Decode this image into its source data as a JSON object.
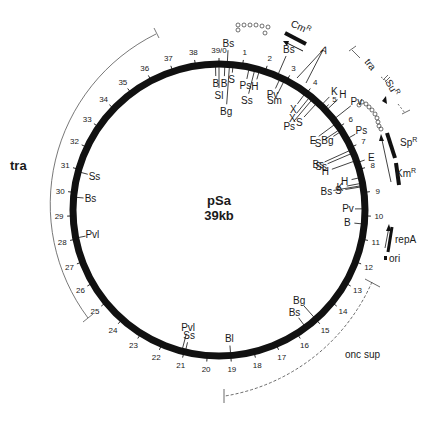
{
  "title": "pSa",
  "size_label": "39kb",
  "total_kb": 39,
  "center": {
    "x": 219,
    "y": 210
  },
  "radius": 146,
  "colors": {
    "backbone": "#111111",
    "text": "#1a1a1a",
    "arc": "#555555"
  },
  "kb_ticks": [
    {
      "pos": 0,
      "label": "39/0"
    },
    {
      "pos": 1,
      "label": "1"
    },
    {
      "pos": 2,
      "label": "2"
    },
    {
      "pos": 3,
      "label": "3"
    },
    {
      "pos": 4,
      "label": "4"
    },
    {
      "pos": 5,
      "label": "5"
    },
    {
      "pos": 6,
      "label": "6"
    },
    {
      "pos": 7,
      "label": "7"
    },
    {
      "pos": 8,
      "label": "8"
    },
    {
      "pos": 9,
      "label": "9"
    },
    {
      "pos": 10,
      "label": "10"
    },
    {
      "pos": 11,
      "label": "11"
    },
    {
      "pos": 12,
      "label": "12"
    },
    {
      "pos": 13,
      "label": "13"
    },
    {
      "pos": 14,
      "label": "14"
    },
    {
      "pos": 15,
      "label": "15"
    },
    {
      "pos": 16,
      "label": "16"
    },
    {
      "pos": 17,
      "label": "17"
    },
    {
      "pos": 18,
      "label": "18"
    },
    {
      "pos": 19,
      "label": "19"
    },
    {
      "pos": 20,
      "label": "20"
    },
    {
      "pos": 21,
      "label": "21"
    },
    {
      "pos": 22,
      "label": "22"
    },
    {
      "pos": 23,
      "label": "23"
    },
    {
      "pos": 24,
      "label": "24"
    },
    {
      "pos": 25,
      "label": "25"
    },
    {
      "pos": 26,
      "label": "26"
    },
    {
      "pos": 27,
      "label": "27"
    },
    {
      "pos": 28,
      "label": "28"
    },
    {
      "pos": 29,
      "label": "29"
    },
    {
      "pos": 30,
      "label": "30"
    },
    {
      "pos": 31,
      "label": "31"
    },
    {
      "pos": 32,
      "label": "32"
    },
    {
      "pos": 33,
      "label": "33"
    },
    {
      "pos": 34,
      "label": "34"
    },
    {
      "pos": 35,
      "label": "35"
    },
    {
      "pos": 36,
      "label": "36"
    },
    {
      "pos": 37,
      "label": "37"
    },
    {
      "pos": 38,
      "label": "38"
    }
  ],
  "sites": [
    {
      "pos": 38.85,
      "label": "B",
      "side": "in",
      "len": 12
    },
    {
      "pos": 39.0,
      "label": "Sl",
      "side": "in",
      "len": 24
    },
    {
      "pos": 0.25,
      "label": "B",
      "side": "in",
      "len": 12
    },
    {
      "pos": 0.35,
      "label": "Bs",
      "side": "out",
      "len": 14
    },
    {
      "pos": 0.45,
      "label": "Bg",
      "side": "in",
      "len": 40
    },
    {
      "pos": 0.6,
      "label": "S",
      "side": "in",
      "len": 8
    },
    {
      "pos": 1.3,
      "label": "Ps",
      "side": "in",
      "len": 12
    },
    {
      "pos": 1.55,
      "label": "Ss",
      "side": "in",
      "len": 26
    },
    {
      "pos": 1.75,
      "label": "H",
      "side": "in",
      "len": 10
    },
    {
      "pos": 2.55,
      "label": "Bs",
      "side": "out",
      "len": 22
    },
    {
      "pos": 2.7,
      "label": "Pv",
      "side": "in",
      "len": 12
    },
    {
      "pos": 2.9,
      "label": "Sm",
      "side": "in",
      "len": 16
    },
    {
      "pos": 3.95,
      "label": "X",
      "side": "in",
      "len": 14
    },
    {
      "pos": 4.2,
      "label": "X",
      "side": "in",
      "len": 22
    },
    {
      "pos": 4.35,
      "label": "Ps",
      "side": "in",
      "len": 30
    },
    {
      "pos": 4.6,
      "label": "S",
      "side": "in",
      "len": 20
    },
    {
      "pos": 4.8,
      "label": "K",
      "side": "out",
      "len": 12
    },
    {
      "pos": 5.1,
      "label": "H",
      "side": "out",
      "len": 16
    },
    {
      "pos": 5.6,
      "label": "Pv",
      "side": "out",
      "len": 22
    },
    {
      "pos": 5.8,
      "label": "E",
      "side": "in",
      "len": 22
    },
    {
      "pos": 6.1,
      "label": "S",
      "side": "in",
      "len": 20
    },
    {
      "pos": 6.2,
      "label": "Bg",
      "side": "in",
      "len": 10
    },
    {
      "pos": 6.6,
      "label": "Ps",
      "side": "out",
      "len": 10
    },
    {
      "pos": 7.1,
      "label": "Bs",
      "side": "in",
      "len": 30
    },
    {
      "pos": 7.25,
      "label": "Ss",
      "side": "in",
      "len": 28
    },
    {
      "pos": 7.6,
      "label": "H",
      "side": "in",
      "len": 26
    },
    {
      "pos": 7.7,
      "label": "E",
      "side": "out",
      "len": 8
    },
    {
      "pos": 8.35,
      "label": "H",
      "side": "in",
      "len": 10
    },
    {
      "pos": 8.6,
      "label": "K",
      "side": "in",
      "len": 16
    },
    {
      "pos": 8.7,
      "label": "Bs",
      "side": "in",
      "len": 30
    },
    {
      "pos": 8.75,
      "label": "S",
      "side": "in",
      "len": 18
    },
    {
      "pos": 9.7,
      "label": "Pv",
      "side": "in",
      "len": 10
    },
    {
      "pos": 10.35,
      "label": "B",
      "side": "in",
      "len": 10
    },
    {
      "pos": 15.0,
      "label": "Bg",
      "side": "in",
      "len": 18
    },
    {
      "pos": 15.55,
      "label": "Bs",
      "side": "in",
      "len": 12
    },
    {
      "pos": 19.0,
      "label": "Bl",
      "side": "in",
      "len": 10
    },
    {
      "pos": 20.95,
      "label": "Ss",
      "side": "in",
      "len": 10
    },
    {
      "pos": 21.1,
      "label": "Pvl",
      "side": "in",
      "len": 18
    },
    {
      "pos": 28.05,
      "label": "Pvl",
      "side": "in",
      "len": 10
    },
    {
      "pos": 29.8,
      "label": "Bs",
      "side": "in",
      "len": 10
    },
    {
      "pos": 30.9,
      "label": "Ss",
      "side": "in",
      "len": 10
    }
  ],
  "genes": [
    {
      "name": "Cm",
      "sup": "R",
      "label_x": 257,
      "label_y": 21
    },
    {
      "name": "A",
      "sup": "",
      "label_x": 321,
      "label_y": 51
    },
    {
      "name": "Su",
      "sup": "R",
      "label_x": 389,
      "label_y": 92
    },
    {
      "name": "Sp",
      "sup": "R",
      "label_x": 399,
      "label_y": 146
    },
    {
      "name": "Km",
      "sup": "R",
      "label_x": 398,
      "label_y": 174
    },
    {
      "name": "repA",
      "sup": "",
      "label_x": 395,
      "label_y": 241
    },
    {
      "name": "ori",
      "sup": "",
      "label_x": 386,
      "label_y": 261
    }
  ],
  "regions": [
    {
      "name": "tra",
      "label_x": 10,
      "label_y": 170
    },
    {
      "name": "tra",
      "label_x": 374,
      "label_y": 58
    },
    {
      "name": "onc sup",
      "label_x": 345,
      "label_y": 358
    }
  ],
  "chart_data": {
    "type": "plasmid_map",
    "title": "pSa",
    "subtitle": "39kb",
    "total_kb": 39,
    "restriction_sites": [
      {
        "kb": 38.85,
        "enzyme": "B"
      },
      {
        "kb": 39.0,
        "enzyme": "Sl"
      },
      {
        "kb": 0.25,
        "enzyme": "B"
      },
      {
        "kb": 0.35,
        "enzyme": "Bs"
      },
      {
        "kb": 0.45,
        "enzyme": "Bg"
      },
      {
        "kb": 0.6,
        "enzyme": "S"
      },
      {
        "kb": 1.3,
        "enzyme": "Ps"
      },
      {
        "kb": 1.55,
        "enzyme": "Ss"
      },
      {
        "kb": 1.75,
        "enzyme": "H"
      },
      {
        "kb": 2.55,
        "enzyme": "Bs"
      },
      {
        "kb": 2.7,
        "enzyme": "Pv"
      },
      {
        "kb": 2.9,
        "enzyme": "Sm"
      },
      {
        "kb": 3.95,
        "enzyme": "X"
      },
      {
        "kb": 4.2,
        "enzyme": "X"
      },
      {
        "kb": 4.35,
        "enzyme": "Ps"
      },
      {
        "kb": 4.6,
        "enzyme": "S"
      },
      {
        "kb": 4.8,
        "enzyme": "K"
      },
      {
        "kb": 5.1,
        "enzyme": "H"
      },
      {
        "kb": 5.6,
        "enzyme": "Pv"
      },
      {
        "kb": 5.8,
        "enzyme": "E"
      },
      {
        "kb": 6.1,
        "enzyme": "S"
      },
      {
        "kb": 6.2,
        "enzyme": "Bg"
      },
      {
        "kb": 6.6,
        "enzyme": "Ps"
      },
      {
        "kb": 7.1,
        "enzyme": "Bs"
      },
      {
        "kb": 7.25,
        "enzyme": "Ss"
      },
      {
        "kb": 7.6,
        "enzyme": "H"
      },
      {
        "kb": 7.7,
        "enzyme": "E"
      },
      {
        "kb": 8.35,
        "enzyme": "H"
      },
      {
        "kb": 8.6,
        "enzyme": "K"
      },
      {
        "kb": 8.7,
        "enzyme": "Bs"
      },
      {
        "kb": 8.75,
        "enzyme": "S"
      },
      {
        "kb": 9.7,
        "enzyme": "Pv"
      },
      {
        "kb": 10.35,
        "enzyme": "B"
      },
      {
        "kb": 15.0,
        "enzyme": "Bg"
      },
      {
        "kb": 15.55,
        "enzyme": "Bs"
      },
      {
        "kb": 19.0,
        "enzyme": "Bl"
      },
      {
        "kb": 20.95,
        "enzyme": "Ss"
      },
      {
        "kb": 21.1,
        "enzyme": "Pvl"
      },
      {
        "kb": 28.05,
        "enzyme": "Pvl"
      },
      {
        "kb": 29.8,
        "enzyme": "Bs"
      },
      {
        "kb": 30.9,
        "enzyme": "Ss"
      }
    ],
    "genes": [
      {
        "name": "CmR",
        "approx_kb": [
          2.0,
          3.0
        ]
      },
      {
        "name": "A",
        "approx_kb": [
          3.9,
          4.4
        ]
      },
      {
        "name": "SuR",
        "approx_kb": [
          6.0,
          7.0
        ]
      },
      {
        "name": "SpR",
        "approx_kb": [
          7.5,
          8.3
        ]
      },
      {
        "name": "KmR",
        "approx_kb": [
          8.6,
          9.3
        ]
      },
      {
        "name": "repA",
        "approx_kb": [
          11.0,
          11.9
        ]
      },
      {
        "name": "ori",
        "approx_kb": [
          12.0,
          12.1
        ]
      }
    ],
    "regions": [
      {
        "name": "tra",
        "approx_kb": [
          24.5,
          36.5
        ]
      },
      {
        "name": "tra",
        "approx_kb": [
          4.5,
          7.5
        ],
        "style": "dashed"
      },
      {
        "name": "onc sup",
        "approx_kb": [
          13.0,
          22.0
        ],
        "style": "dashed"
      }
    ]
  }
}
